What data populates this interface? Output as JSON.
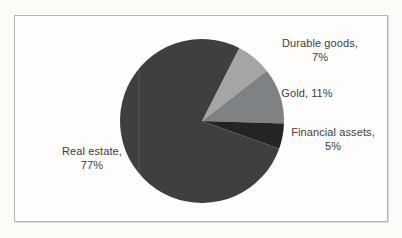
{
  "page": {
    "background_color": "#fbfbf8",
    "frame_background_color": "#fefdfb",
    "frame_border_color": "#b4b4b4"
  },
  "chart_data": {
    "type": "pie",
    "title": "",
    "legend": "none",
    "labels_position": "outside",
    "direction": "clockwise",
    "start_angle_deg": 27,
    "label_color": "#404040",
    "categories": [
      "Durable goods",
      "Gold",
      "Financial assets",
      "Real estate"
    ],
    "values": [
      7,
      11,
      5,
      77
    ],
    "slices": [
      {
        "label": "Durable goods",
        "value_pct": 7,
        "color": "#a3a5a6",
        "label_lines": [
          "Durable goods,",
          "7%"
        ]
      },
      {
        "label": "Gold",
        "value_pct": 11,
        "color": "#7f8284",
        "label_lines": [
          "Gold, 11%"
        ]
      },
      {
        "label": "Financial assets",
        "value_pct": 5,
        "color": "#242425",
        "label_lines": [
          "Financial assets,",
          "5%"
        ]
      },
      {
        "label": "Real estate",
        "value_pct": 77,
        "color": "#3e3f40",
        "label_lines": [
          "Real estate,",
          "77%"
        ]
      }
    ]
  }
}
